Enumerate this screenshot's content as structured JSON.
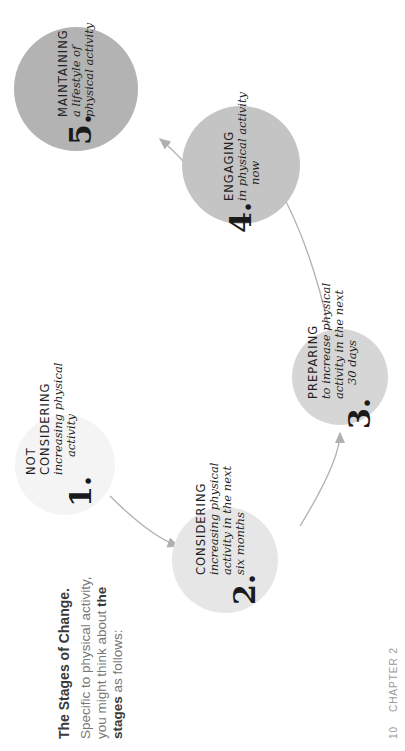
{
  "intro": {
    "title": "The Stages of Change.",
    "body_pre": "Specific to physical activity, you might think about ",
    "body_bold": "the stages",
    "body_post": " as follows:"
  },
  "stages": [
    {
      "number": "1.",
      "title_lines": [
        "NOT",
        "CONSIDERING"
      ],
      "desc_lines": [
        "increasing physical",
        "activity"
      ],
      "circle_color": "#f4f4f4"
    },
    {
      "number": "2.",
      "title_lines": [
        "CONSIDERING"
      ],
      "desc_lines": [
        "increasing physical",
        "activity in the next",
        "six months"
      ],
      "circle_color": "#e6e6e6"
    },
    {
      "number": "3.",
      "title_lines": [
        "PREPARING"
      ],
      "desc_lines": [
        "to increase physical",
        "activity in the next",
        "30 days"
      ],
      "circle_color": "#d6d6d6"
    },
    {
      "number": "4.",
      "title_lines": [
        "ENGAGING"
      ],
      "desc_lines": [
        "in physical activity",
        "now"
      ],
      "circle_color": "#c4c4c4"
    },
    {
      "number": "5.",
      "title_lines": [
        "MAINTAINING"
      ],
      "desc_lines": [
        "a lifestyle of",
        "physical activity"
      ],
      "circle_color": "#b3b3b3"
    }
  ],
  "colors": {
    "arrow": "#b0b0b0"
  },
  "footer": {
    "page_number": "10",
    "chapter": "CHAPTER 2"
  }
}
